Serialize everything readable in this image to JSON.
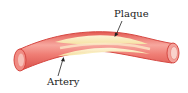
{
  "diagram": {
    "labels": {
      "plaque": "Plaque",
      "artery": "Artery"
    },
    "colors": {
      "artery_outer": "#e8625a",
      "artery_mid": "#f28f86",
      "artery_highlight": "#f9b8b0",
      "artery_edge": "#d94a44",
      "plaque_fill": "#f8edb5",
      "plaque_light": "#fdf8dc",
      "lumen_end": "#f5c2bb",
      "arrow": "#222222"
    }
  }
}
